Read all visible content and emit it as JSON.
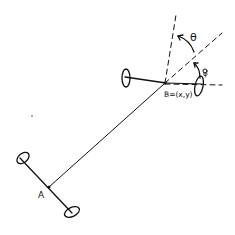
{
  "diagram": {
    "title": "",
    "labels": {
      "point_a": "A",
      "point_b": "B=(x,y)",
      "theta": "θ",
      "phi": "φ"
    },
    "colors": {
      "ink": "#111111",
      "background": "#ffffff"
    },
    "elements": [
      "rear-axle",
      "rear-wheel-left",
      "rear-wheel-right",
      "body-link",
      "front-axle",
      "front-wheel-left",
      "front-wheel-right",
      "dashed-heading-reference",
      "dashed-vertical-reference",
      "dashed-horizontal-reference",
      "theta-arc",
      "phi-arc"
    ]
  }
}
